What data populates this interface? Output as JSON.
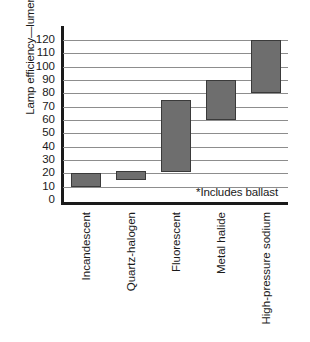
{
  "chart_data": {
    "type": "bar",
    "subtype": "floating-range-bar",
    "title": "",
    "xlabel": "",
    "ylabel": "Lamp efficiency—lumens/watt*",
    "ylim": [
      0,
      120
    ],
    "ytick_step": 10,
    "yticks": [
      120,
      110,
      100,
      90,
      80,
      70,
      60,
      50,
      40,
      30,
      20,
      10,
      0
    ],
    "grid": true,
    "grid_axis": "y",
    "legend": false,
    "categories": [
      "Incandescent",
      "Quartz-halogen",
      "Fluorescent",
      "Metal halide",
      "High-pressure sodium"
    ],
    "series": [
      {
        "name": "Low",
        "values": [
          10,
          15,
          21,
          60,
          80
        ]
      },
      {
        "name": "High",
        "values": [
          20,
          22,
          75,
          90,
          120
        ]
      }
    ],
    "ranges": [
      {
        "category": "Incandescent",
        "low": 10,
        "high": 20
      },
      {
        "category": "Quartz-halogen",
        "low": 15,
        "high": 22
      },
      {
        "category": "Fluorescent",
        "low": 21,
        "high": 75
      },
      {
        "category": "Metal halide",
        "low": 60,
        "high": 90
      },
      {
        "category": "High-pressure sodium",
        "low": 80,
        "high": 120
      }
    ],
    "annotations": [
      {
        "text": "*Includes ballast",
        "position": "inside-plot-right-bottom"
      }
    ],
    "colors": {
      "bar_fill": "#6e6e6e",
      "bar_stroke": "#3a3a3a",
      "gridline": "#8d8d8d",
      "axis": "#1a1a1a",
      "background": "#ffffff",
      "text": "#1a1a1a"
    }
  },
  "footnote": {
    "text": "*Includes ballast"
  }
}
